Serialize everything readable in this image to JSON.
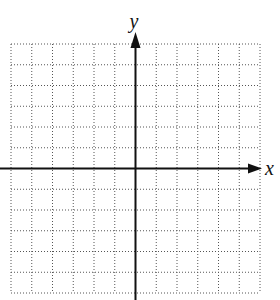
{
  "diagram": {
    "type": "coordinate-grid",
    "x_axis_label": "x",
    "y_axis_label": "y",
    "grid": {
      "columns": 12,
      "rows": 12,
      "style": "dotted",
      "left": 11,
      "top": 44,
      "cell": 20.75
    },
    "axes": {
      "origin_col": 6,
      "origin_row": 6,
      "color": "#111111",
      "grid_color": "#555555"
    }
  }
}
